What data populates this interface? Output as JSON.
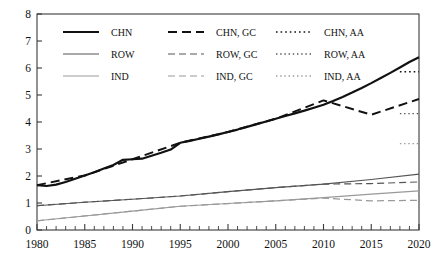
{
  "chart_data": {
    "type": "line",
    "title": "",
    "xlabel": "",
    "ylabel": "",
    "xlim": [
      1980,
      2020
    ],
    "ylim": [
      0,
      8
    ],
    "yticks": [
      "0",
      "1",
      "2",
      "3",
      "4",
      "5",
      "6",
      "7",
      "8"
    ],
    "xticks": [
      "1980",
      "1985",
      "1990",
      "1995",
      "2000",
      "2005",
      "2010",
      "2015",
      "2020"
    ],
    "x_minor_tick_step": 1,
    "grid": false,
    "legend_position": "top-left-inside",
    "legend_columns": 3,
    "series": [
      {
        "name": "CHN",
        "style": "solid",
        "color": "#111111",
        "width": 2.2,
        "x": [
          1980,
          1981,
          1982,
          1983,
          1984,
          1985,
          1986,
          1987,
          1988,
          1989,
          1990,
          1991,
          1992,
          1993,
          1994,
          1995,
          1996,
          1997,
          1998,
          1999,
          2000,
          2001,
          2002,
          2003,
          2004,
          2005,
          2006,
          2007,
          2008,
          2009,
          2010,
          2011,
          2012,
          2013,
          2014,
          2015,
          2016,
          2017,
          2018,
          2019,
          2020
        ],
        "values": [
          1.66,
          1.63,
          1.68,
          1.78,
          1.9,
          2.02,
          2.14,
          2.28,
          2.41,
          2.6,
          2.62,
          2.64,
          2.75,
          2.86,
          2.98,
          3.23,
          3.3,
          3.38,
          3.46,
          3.54,
          3.63,
          3.72,
          3.82,
          3.92,
          4.02,
          4.12,
          4.22,
          4.32,
          4.42,
          4.53,
          4.64,
          4.78,
          4.93,
          5.09,
          5.26,
          5.44,
          5.63,
          5.82,
          6.02,
          6.22,
          6.4
        ]
      },
      {
        "name": "ROW",
        "style": "solid",
        "color": "#555555",
        "width": 1.1,
        "x": [
          1980,
          1985,
          1990,
          1995,
          2000,
          2005,
          2010,
          2015,
          2020
        ],
        "values": [
          0.9,
          1.03,
          1.14,
          1.26,
          1.42,
          1.57,
          1.7,
          1.87,
          2.07
        ]
      },
      {
        "name": "IND",
        "style": "solid",
        "color": "#999999",
        "width": 1.1,
        "x": [
          1980,
          1985,
          1990,
          1995,
          2000,
          2005,
          2010,
          2015,
          2020
        ],
        "values": [
          0.34,
          0.52,
          0.7,
          0.88,
          0.98,
          1.08,
          1.2,
          1.33,
          1.45
        ]
      },
      {
        "name": "CHN, GC",
        "style": "dashed",
        "color": "#111111",
        "width": 2.0,
        "x": [
          1980,
          1985,
          1990,
          1995,
          2000,
          2005,
          2010,
          2015,
          2020
        ],
        "values": [
          1.66,
          2.02,
          2.62,
          3.23,
          3.63,
          4.12,
          4.8,
          4.27,
          4.85
        ]
      },
      {
        "name": "ROW, GC",
        "style": "dashed",
        "color": "#555555",
        "width": 1.2,
        "x": [
          1980,
          1985,
          1990,
          1995,
          2000,
          2005,
          2010,
          2015,
          2020
        ],
        "values": [
          0.9,
          1.03,
          1.14,
          1.26,
          1.42,
          1.57,
          1.7,
          1.72,
          1.78
        ]
      },
      {
        "name": "IND, GC",
        "style": "dashed",
        "color": "#999999",
        "width": 1.2,
        "x": [
          1980,
          1985,
          1990,
          1995,
          2000,
          2005,
          2010,
          2015,
          2020
        ],
        "values": [
          0.34,
          0.52,
          0.7,
          0.88,
          0.98,
          1.08,
          1.18,
          1.08,
          1.1
        ]
      },
      {
        "name": "CHN, AA",
        "style": "dotted",
        "color": "#111111",
        "width": 1.6,
        "x": [
          2018,
          2020
        ],
        "values": [
          5.86,
          5.86
        ]
      },
      {
        "name": "ROW, AA",
        "style": "dotted",
        "color": "#555555",
        "width": 1.4,
        "x": [
          2018,
          2020
        ],
        "values": [
          4.31,
          4.31
        ]
      },
      {
        "name": "IND, AA",
        "style": "dotted",
        "color": "#999999",
        "width": 1.4,
        "x": [
          2018,
          2020
        ],
        "values": [
          3.2,
          3.2
        ]
      }
    ],
    "legend": [
      {
        "label": "CHN",
        "style": "solid",
        "color": "#111111",
        "width": 2.2
      },
      {
        "label": "CHN, GC",
        "style": "dashed",
        "color": "#111111",
        "width": 2.0
      },
      {
        "label": "CHN, AA",
        "style": "dotted",
        "color": "#111111",
        "width": 1.6
      },
      {
        "label": "ROW",
        "style": "solid",
        "color": "#555555",
        "width": 1.2
      },
      {
        "label": "ROW, GC",
        "style": "dashed",
        "color": "#555555",
        "width": 1.2
      },
      {
        "label": "ROW, AA",
        "style": "dotted",
        "color": "#555555",
        "width": 1.3
      },
      {
        "label": "IND",
        "style": "solid",
        "color": "#999999",
        "width": 1.2
      },
      {
        "label": "IND, GC",
        "style": "dashed",
        "color": "#999999",
        "width": 1.2
      },
      {
        "label": "IND, AA",
        "style": "dotted",
        "color": "#999999",
        "width": 1.3
      }
    ]
  }
}
